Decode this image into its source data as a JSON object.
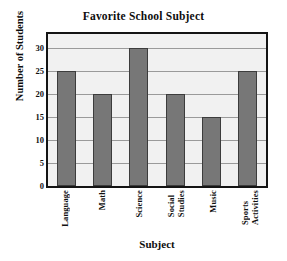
{
  "chart_data": {
    "type": "bar",
    "title": "Favorite School Subject",
    "xlabel": "Subject",
    "ylabel": "Number of Students",
    "categories": [
      "Language",
      "Math",
      "Science",
      "Social Studies",
      "Music",
      "Sports Activities"
    ],
    "category_lines": [
      [
        "Language"
      ],
      [
        "Math"
      ],
      [
        "Science"
      ],
      [
        "Social",
        "Studies"
      ],
      [
        "Music"
      ],
      [
        "Sports",
        "Activities"
      ]
    ],
    "values": [
      25,
      20,
      30,
      20,
      15,
      25
    ],
    "ylim": [
      0,
      33
    ],
    "yticks": [
      0,
      5,
      10,
      15,
      20,
      25,
      30
    ],
    "ytick_labels": [
      "0",
      "5",
      "10",
      "15",
      "20",
      "25",
      "30"
    ],
    "grid": true,
    "grid_axis": "y",
    "legend": false,
    "tick_label_rotation": 90,
    "colors": {
      "bar_fill": "#777777",
      "bar_edge": "#3c3c3c",
      "plot_background": "#f1f1f1",
      "frame": "#141414",
      "gridline": "#9a9a9a",
      "text": "#111111",
      "figure_background": "#ffffff"
    }
  }
}
